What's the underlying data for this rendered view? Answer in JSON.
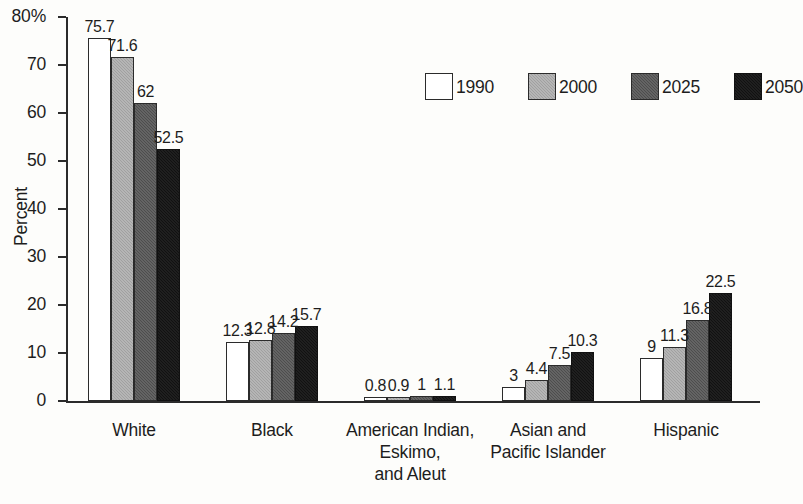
{
  "chart_data": {
    "type": "bar",
    "title": "",
    "subtitle": "",
    "xlabel": "",
    "ylabel": "Percent",
    "ylim": [
      0,
      80
    ],
    "ytick_labels": [
      "80%",
      "70",
      "60",
      "50",
      "40",
      "30",
      "20",
      "10",
      "0"
    ],
    "ytick_values": [
      80,
      70,
      60,
      50,
      40,
      30,
      20,
      10,
      0
    ],
    "grid": false,
    "legend_position": "top-right",
    "categories": [
      "White",
      "Black",
      "American Indian, Eskimo, and Aleut",
      "Asian and Pacific Islander",
      "Hispanic"
    ],
    "category_label_lines": [
      [
        "White"
      ],
      [
        "Black"
      ],
      [
        "American Indian,",
        "Eskimo,",
        "and Aleut"
      ],
      [
        "Asian and",
        "Pacific Islander"
      ],
      [
        "Hispanic"
      ]
    ],
    "series": [
      {
        "name": "1990",
        "color": "#ffffff",
        "values": [
          75.7,
          12.3,
          0.8,
          3,
          9
        ],
        "labels": [
          "75.7",
          "12.3",
          "0.8",
          "3",
          "9"
        ]
      },
      {
        "name": "2000",
        "color": "#a0a0a0",
        "values": [
          71.6,
          12.8,
          0.9,
          4.4,
          11.3
        ],
        "labels": [
          "71.6",
          "12.8",
          "0.9",
          "4.4",
          "11.3"
        ]
      },
      {
        "name": "2025",
        "color": "#4d4d4d",
        "values": [
          62,
          14.2,
          1,
          7.5,
          16.8
        ],
        "labels": [
          "62",
          "14.2",
          "1",
          "7.5",
          "16.8"
        ]
      },
      {
        "name": "2050",
        "color": "#111111",
        "values": [
          52.5,
          15.7,
          1.1,
          10.3,
          22.5
        ],
        "labels": [
          "52.5",
          "15.7",
          "1.1",
          "10.3",
          "22.5"
        ]
      }
    ]
  },
  "legend": {
    "items": [
      {
        "label": "1990",
        "swatch": "white-swatch"
      },
      {
        "label": "2000",
        "swatch": "light-gray-swatch"
      },
      {
        "label": "2025",
        "swatch": "dark-gray-swatch"
      },
      {
        "label": "2050",
        "swatch": "black-swatch"
      }
    ]
  },
  "axis": {
    "y_title": "Percent"
  }
}
